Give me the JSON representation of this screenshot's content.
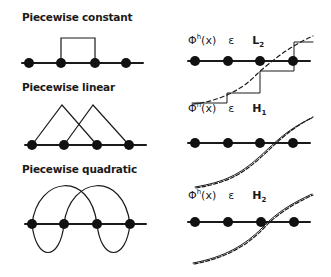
{
  "panels": {
    "constant": {
      "title": "Piecewise constant"
    },
    "linear": {
      "title": "Piecewise linear"
    },
    "quadratic": {
      "title": "Piecewise quadratic"
    }
  },
  "approximations": [
    {
      "phi": "Φ",
      "sup": "h",
      "arg": "(x)",
      "in": "ε",
      "space": "L",
      "sub": "2"
    },
    {
      "phi": "Φ",
      "sup": "h",
      "arg": "(x)",
      "in": "ε",
      "space": "H",
      "sub": "1"
    },
    {
      "phi": "Φ",
      "sup": "h",
      "arg": "(x)",
      "in": "ε",
      "space": "H",
      "sub": "2"
    }
  ]
}
